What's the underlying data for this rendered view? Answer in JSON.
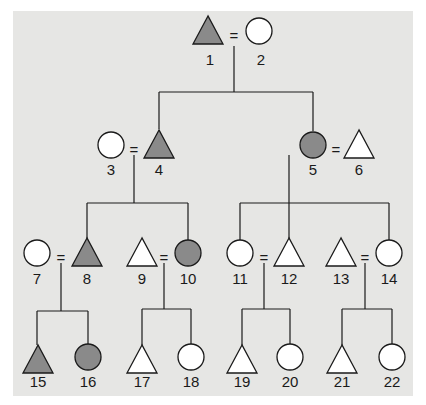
{
  "diagram": {
    "type": "pedigree",
    "colors": {
      "background": "#e6e6e4",
      "affected_fill": "#8a8a8a",
      "unaffected_fill": "#ffffff",
      "stroke": "#1a1a1a"
    },
    "legend_semantics": {
      "triangle": "male",
      "circle": "female",
      "filled": "affected",
      "open": "unaffected",
      "equals": "mating"
    },
    "individuals": [
      {
        "id": "1",
        "label": "1",
        "shape": "triangle",
        "affected": true,
        "x": 208,
        "y": 31,
        "lx": 210,
        "ly": 65
      },
      {
        "id": "2",
        "label": "2",
        "shape": "circle",
        "affected": false,
        "x": 259,
        "y": 31,
        "lx": 261,
        "ly": 65
      },
      {
        "id": "3",
        "label": "3",
        "shape": "circle",
        "affected": false,
        "x": 111,
        "y": 145,
        "lx": 111,
        "ly": 175
      },
      {
        "id": "4",
        "label": "4",
        "shape": "triangle",
        "affected": true,
        "x": 159,
        "y": 145,
        "lx": 159,
        "ly": 175
      },
      {
        "id": "5",
        "label": "5",
        "shape": "circle",
        "affected": true,
        "x": 313,
        "y": 145,
        "lx": 313,
        "ly": 175
      },
      {
        "id": "6",
        "label": "6",
        "shape": "triangle",
        "affected": false,
        "x": 359,
        "y": 145,
        "lx": 359,
        "ly": 175
      },
      {
        "id": "7",
        "label": "7",
        "shape": "circle",
        "affected": false,
        "x": 37,
        "y": 253,
        "lx": 37,
        "ly": 284
      },
      {
        "id": "8",
        "label": "8",
        "shape": "triangle",
        "affected": true,
        "x": 87,
        "y": 253,
        "lx": 87,
        "ly": 284
      },
      {
        "id": "9",
        "label": "9",
        "shape": "triangle",
        "affected": false,
        "x": 142,
        "y": 253,
        "lx": 142,
        "ly": 284
      },
      {
        "id": "10",
        "label": "10",
        "shape": "circle",
        "affected": true,
        "x": 188,
        "y": 253,
        "lx": 188,
        "ly": 284
      },
      {
        "id": "11",
        "label": "11",
        "shape": "circle",
        "affected": false,
        "x": 240,
        "y": 253,
        "lx": 240,
        "ly": 284
      },
      {
        "id": "12",
        "label": "12",
        "shape": "triangle",
        "affected": false,
        "x": 289,
        "y": 253,
        "lx": 289,
        "ly": 284
      },
      {
        "id": "13",
        "label": "13",
        "shape": "triangle",
        "affected": false,
        "x": 341,
        "y": 253,
        "lx": 341,
        "ly": 284
      },
      {
        "id": "14",
        "label": "14",
        "shape": "circle",
        "affected": false,
        "x": 389,
        "y": 253,
        "lx": 389,
        "ly": 284
      },
      {
        "id": "15",
        "label": "15",
        "shape": "triangle",
        "affected": true,
        "x": 38,
        "y": 360,
        "lx": 38,
        "ly": 387
      },
      {
        "id": "16",
        "label": "16",
        "shape": "circle",
        "affected": true,
        "x": 88,
        "y": 357,
        "lx": 88,
        "ly": 387
      },
      {
        "id": "17",
        "label": "17",
        "shape": "triangle",
        "affected": false,
        "x": 142,
        "y": 360,
        "lx": 142,
        "ly": 387
      },
      {
        "id": "18",
        "label": "18",
        "shape": "circle",
        "affected": false,
        "x": 191,
        "y": 357,
        "lx": 191,
        "ly": 387
      },
      {
        "id": "19",
        "label": "19",
        "shape": "triangle",
        "affected": false,
        "x": 242,
        "y": 360,
        "lx": 242,
        "ly": 387
      },
      {
        "id": "20",
        "label": "20",
        "shape": "circle",
        "affected": false,
        "x": 290,
        "y": 357,
        "lx": 290,
        "ly": 387
      },
      {
        "id": "21",
        "label": "21",
        "shape": "triangle",
        "affected": false,
        "x": 342,
        "y": 360,
        "lx": 342,
        "ly": 387
      },
      {
        "id": "22",
        "label": "22",
        "shape": "circle",
        "affected": false,
        "x": 392,
        "y": 357,
        "lx": 392,
        "ly": 387
      }
    ],
    "matings": [
      {
        "partners": [
          "1",
          "2"
        ],
        "eq_x": 234,
        "eq_y": 36
      },
      {
        "partners": [
          "3",
          "4"
        ],
        "eq_x": 134,
        "eq_y": 150
      },
      {
        "partners": [
          "5",
          "6"
        ],
        "eq_x": 336,
        "eq_y": 150
      },
      {
        "partners": [
          "7",
          "8"
        ],
        "eq_x": 61,
        "eq_y": 258
      },
      {
        "partners": [
          "9",
          "10"
        ],
        "eq_x": 164,
        "eq_y": 258
      },
      {
        "partners": [
          "11",
          "12"
        ],
        "eq_x": 264,
        "eq_y": 258
      },
      {
        "partners": [
          "13",
          "14"
        ],
        "eq_x": 365,
        "eq_y": 258
      }
    ],
    "lines": [
      [
        234,
        46,
        234,
        92
      ],
      [
        159,
        92,
        313,
        92
      ],
      [
        159,
        92,
        159,
        129
      ],
      [
        313,
        92,
        313,
        131
      ],
      [
        134,
        155,
        134,
        203
      ],
      [
        87,
        203,
        188,
        203
      ],
      [
        87,
        203,
        87,
        238
      ],
      [
        188,
        203,
        188,
        240
      ],
      [
        289,
        155,
        289,
        203
      ],
      [
        240,
        203,
        389,
        203
      ],
      [
        240,
        203,
        240,
        240
      ],
      [
        289,
        203,
        289,
        238
      ],
      [
        389,
        203,
        389,
        240
      ],
      [
        61,
        263,
        61,
        311
      ],
      [
        37,
        311,
        88,
        311
      ],
      [
        37,
        311,
        37,
        345
      ],
      [
        88,
        311,
        88,
        344
      ],
      [
        164,
        263,
        164,
        309
      ],
      [
        142,
        309,
        191,
        309
      ],
      [
        142,
        309,
        142,
        345
      ],
      [
        191,
        309,
        191,
        344
      ],
      [
        264,
        263,
        264,
        309
      ],
      [
        242,
        309,
        290,
        309
      ],
      [
        242,
        309,
        242,
        345
      ],
      [
        290,
        309,
        290,
        344
      ],
      [
        365,
        263,
        365,
        309
      ],
      [
        342,
        309,
        392,
        309
      ],
      [
        342,
        309,
        342,
        345
      ],
      [
        392,
        309,
        392,
        344
      ]
    ],
    "equals_symbol": "="
  }
}
